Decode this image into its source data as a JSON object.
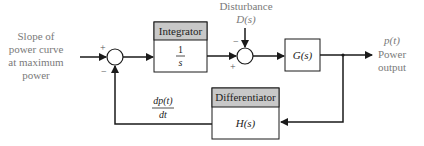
{
  "diagram": {
    "type": "block-diagram",
    "colors": {
      "line": "#1a1a1a",
      "header_fill": "#c8c8c8",
      "box_fill": "#ffffff",
      "io_text": "#7a7a7a",
      "body_text": "#222222"
    },
    "input": {
      "lines": [
        "Slope of",
        "power curve",
        "at maximum",
        "power"
      ]
    },
    "sum1": {
      "plus": "+",
      "minus": "−"
    },
    "integrator": {
      "header": "Integrator",
      "num": "1",
      "den": "s"
    },
    "disturbance": {
      "line1": "Disturbance",
      "line2": "D(s)"
    },
    "sum2": {
      "plus": "+",
      "minus": "−"
    },
    "plant": {
      "label": "G(s)"
    },
    "output": {
      "line1": "p(t)",
      "line2": "Power",
      "line3": "output"
    },
    "differentiator": {
      "header": "Differentiator",
      "label": "H(s)"
    },
    "feedback_label": {
      "num": "dp(t)",
      "den": "dt"
    }
  }
}
